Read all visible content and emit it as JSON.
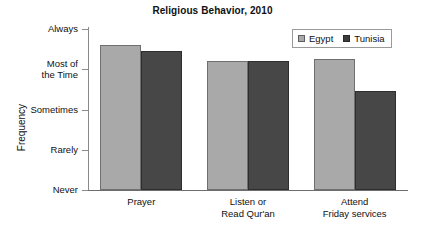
{
  "chart_data": {
    "type": "bar",
    "title": "Religious Behavior, 2010",
    "xlabel": "",
    "ylabel": "Frequency",
    "grid": false,
    "legend_position": "top-right",
    "categories": [
      "Prayer",
      "Listen or\nRead Qur'an",
      "Attend\nFriday services"
    ],
    "y_tick_labels": [
      "Never",
      "Rarely",
      "Sometimes",
      "Most of\nthe Time",
      "Always"
    ],
    "y_tick_values": [
      0,
      1,
      2,
      3,
      4
    ],
    "ylim": [
      0,
      4
    ],
    "series": [
      {
        "name": "Egypt",
        "color": "#a9a9a9",
        "values": [
          3.6,
          3.2,
          3.25
        ]
      },
      {
        "name": "Tunisia",
        "color": "#474747",
        "values": [
          3.45,
          3.2,
          2.45
        ]
      }
    ]
  },
  "legend": {
    "entries": [
      {
        "label": "Egypt",
        "swatch": "egypt-color-swatch"
      },
      {
        "label": "Tunisia",
        "swatch": "tunisia-color-swatch"
      }
    ]
  }
}
